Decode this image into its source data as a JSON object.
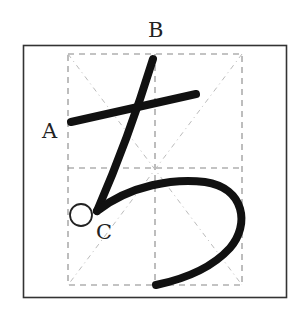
{
  "diagram": {
    "character": "ち",
    "labels": {
      "a": "A",
      "b": "B",
      "c": "C"
    },
    "colors": {
      "stroke": "#111111",
      "frame": "#333333",
      "guide": "#888888",
      "diagonal": "#bbbbbb"
    },
    "frame": {
      "x": 23,
      "y": 45,
      "width": 263,
      "height": 252
    },
    "guide_box": {
      "x": 68,
      "y": 54,
      "width": 174,
      "height": 231
    }
  }
}
